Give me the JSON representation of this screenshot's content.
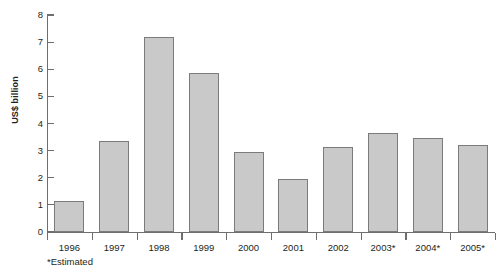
{
  "chart_data": {
    "type": "bar",
    "title": "",
    "subtitle": "",
    "xlabel": "",
    "ylabel": "US$ billion",
    "categories": [
      "1996",
      "1997",
      "1998",
      "1999",
      "2000",
      "2001",
      "2002",
      "2003*",
      "2004*",
      "2005*"
    ],
    "values": [
      1.15,
      3.35,
      7.2,
      5.85,
      2.95,
      1.95,
      3.15,
      3.65,
      3.45,
      3.2
    ],
    "ylim": [
      0,
      8
    ],
    "ytick_labels": [
      "0",
      "1",
      "2",
      "3",
      "4",
      "5",
      "6",
      "7",
      "8"
    ],
    "ytick_values": [
      0,
      1,
      2,
      3,
      4,
      5,
      6,
      7,
      8
    ],
    "grid": false,
    "legend": null,
    "annotations": [
      "*Estimated"
    ],
    "bar_fill_color": "#c9c9c9",
    "bar_border_color": "#7a7b7d",
    "axis_color": "#6d6e70",
    "text_color": "#231f20",
    "background_color": "#ffffff"
  },
  "footnote": "*Estimated"
}
